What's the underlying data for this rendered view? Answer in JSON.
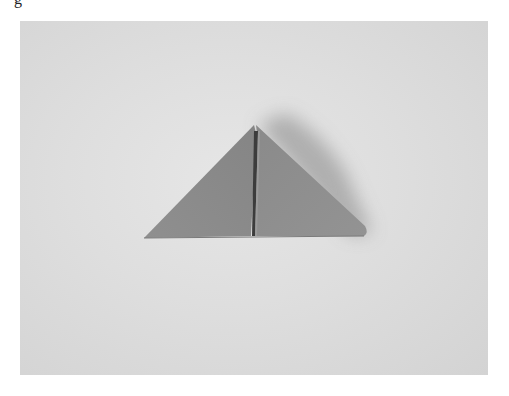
{
  "page": {
    "caption_fragment": "g"
  },
  "photo": {
    "subject": "folded paper triangle (origami unit) on light paper background",
    "colors": {
      "background": "#dedede",
      "paper_left_face": "#8c8c8c",
      "paper_right_face": "#8a8a8a",
      "crease": "#3c3c3c",
      "shadow": "#a9a9a9"
    }
  }
}
